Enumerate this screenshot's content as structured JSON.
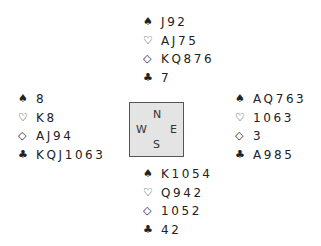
{
  "suits": {
    "spades": "♠",
    "hearts": "♡",
    "diamonds": "◇",
    "clubs": "♣"
  },
  "hands": {
    "north": {
      "spades": "J92",
      "hearts": "AJ75",
      "diamonds": "KQ876",
      "clubs": "7"
    },
    "west": {
      "spades": "8",
      "hearts": "K8",
      "diamonds": "AJ94",
      "clubs": "KQJ1063"
    },
    "east": {
      "spades": "AQ763",
      "hearts": "1063",
      "diamonds": "3",
      "clubs": "A985"
    },
    "south": {
      "spades": "K1054",
      "hearts": "Q942",
      "diamonds": "1052",
      "clubs": "42"
    }
  },
  "compass": {
    "north": "N",
    "south": "S",
    "west": "W",
    "east": "E"
  }
}
